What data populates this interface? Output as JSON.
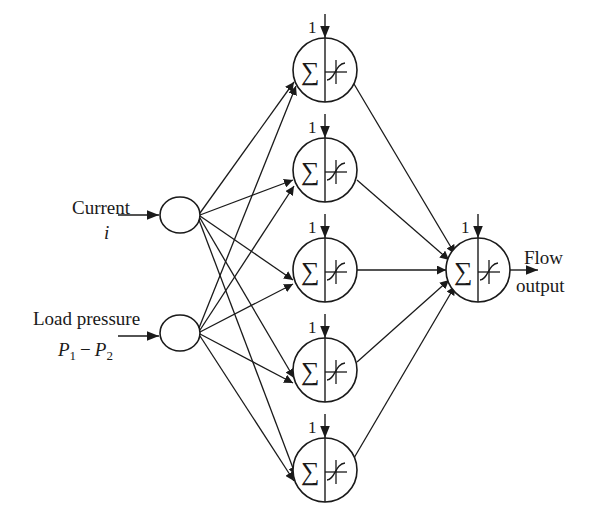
{
  "diagram": {
    "type": "neural-network",
    "colors": {
      "stroke": "#1a1a1a",
      "background": "#ffffff"
    },
    "inputs": [
      {
        "label": "Current",
        "symbol": "i"
      },
      {
        "label": "Load pressure",
        "symbol_p1": "P",
        "sub1": "1",
        "minus": "−",
        "symbol_p2": "P",
        "sub2": "2"
      }
    ],
    "hidden_nodes": [
      {
        "bias": "1",
        "sum_symbol": "∑"
      },
      {
        "bias": "1",
        "sum_symbol": "∑"
      },
      {
        "bias": "1",
        "sum_symbol": "∑"
      },
      {
        "bias": "1",
        "sum_symbol": "∑"
      },
      {
        "bias": "1",
        "sum_symbol": "∑"
      }
    ],
    "output_node": {
      "bias": "1",
      "sum_symbol": "∑",
      "label_line1": "Flow",
      "label_line2": "output"
    }
  }
}
